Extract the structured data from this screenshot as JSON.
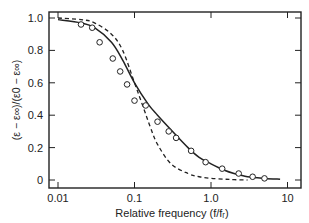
{
  "chart_data": {
    "type": "line",
    "title": "",
    "xlabel": "Relative frequency (f/f_r)",
    "ylabel": "(ε − ε∞)/(ε0 − ε∞)",
    "xscale": "log",
    "xlim": [
      0.01,
      12
    ],
    "ylim": [
      0,
      1.0
    ],
    "x_ticks": [
      "0.01",
      "0.1",
      "1.0",
      "10"
    ],
    "y_ticks": [
      "0",
      "0.2",
      "0.4",
      "0.6",
      "0.8",
      "1.0"
    ],
    "grid": false,
    "legend": null,
    "series": [
      {
        "name": "measured",
        "style": "open-circle markers",
        "x": [
          0.02,
          0.028,
          0.035,
          0.052,
          0.065,
          0.08,
          0.1,
          0.14,
          0.2,
          0.28,
          0.35,
          0.55,
          0.85,
          1.4,
          2.3,
          3.5,
          5.0
        ],
        "y": [
          0.96,
          0.94,
          0.85,
          0.75,
          0.67,
          0.59,
          0.49,
          0.46,
          0.36,
          0.3,
          0.26,
          0.18,
          0.11,
          0.07,
          0.04,
          0.02,
          0.01
        ]
      },
      {
        "name": "fit (solid)",
        "style": "solid line",
        "x": [
          0.01,
          0.02,
          0.03,
          0.05,
          0.07,
          0.1,
          0.15,
          0.2,
          0.3,
          0.5,
          0.7,
          1.0,
          1.5,
          2,
          3,
          5,
          8
        ],
        "y": [
          0.99,
          0.97,
          0.94,
          0.85,
          0.74,
          0.6,
          0.47,
          0.4,
          0.31,
          0.2,
          0.14,
          0.1,
          0.06,
          0.04,
          0.02,
          0.01,
          0.005
        ]
      },
      {
        "name": "Debye (dashed)",
        "style": "dashed line",
        "x": [
          0.01,
          0.02,
          0.03,
          0.05,
          0.07,
          0.1,
          0.13,
          0.16,
          0.2,
          0.3,
          0.5,
          0.7,
          1.0,
          1.5,
          2,
          3
        ],
        "y": [
          1.0,
          0.99,
          0.97,
          0.9,
          0.8,
          0.6,
          0.45,
          0.33,
          0.22,
          0.1,
          0.04,
          0.02,
          0.01,
          0.005,
          0.002,
          0.0
        ]
      }
    ]
  }
}
